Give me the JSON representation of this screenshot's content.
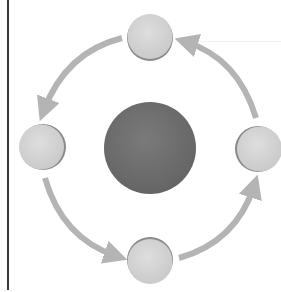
{
  "diagram": {
    "type": "cycle",
    "direction": "counter-clockwise",
    "colors": {
      "center_fill": "#6e6e6e",
      "satellite_fill": "#d2d2d2",
      "satellite_edge": "#8a8a8a",
      "arrow": "#b4b4b4",
      "frame_line": "#3a3a3a",
      "background": "#ffffff"
    },
    "center": {
      "name": "center-circle",
      "cx": 150,
      "cy": 148,
      "r": 46,
      "label": ""
    },
    "nodes": [
      {
        "name": "node-top",
        "cx": 150,
        "cy": 37,
        "r": 23,
        "label": ""
      },
      {
        "name": "node-left",
        "cx": 42,
        "cy": 147,
        "r": 23,
        "label": ""
      },
      {
        "name": "node-bottom",
        "cx": 150,
        "cy": 261,
        "r": 23,
        "label": ""
      },
      {
        "name": "node-right",
        "cx": 259,
        "cy": 149,
        "r": 23,
        "label": ""
      }
    ],
    "arrows": [
      {
        "name": "arrow-top-to-left",
        "from": "node-top",
        "to": "node-left"
      },
      {
        "name": "arrow-left-to-bottom",
        "from": "node-left",
        "to": "node-bottom"
      },
      {
        "name": "arrow-bottom-to-right",
        "from": "node-bottom",
        "to": "node-right"
      },
      {
        "name": "arrow-right-to-top",
        "from": "node-right",
        "to": "node-top"
      }
    ]
  }
}
